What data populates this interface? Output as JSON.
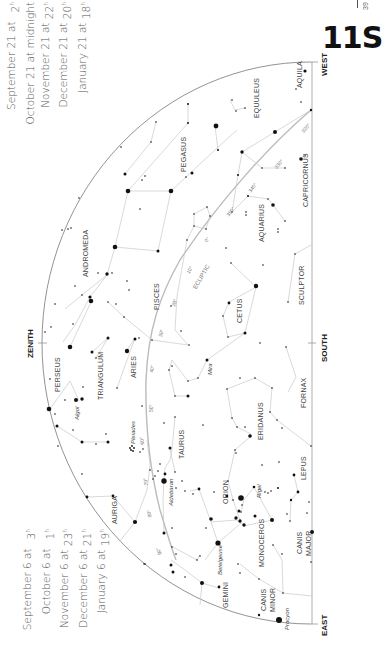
{
  "page": {
    "chart_id": "11S",
    "page_number": "39"
  },
  "times_top": {
    "rows": [
      {
        "date": "September 21 at",
        "time": "2",
        "sup": "h"
      },
      {
        "date": "October 21 at midnight",
        "time": "",
        "sup": ""
      },
      {
        "date": "November 21 at",
        "time": "22",
        "sup": "h"
      },
      {
        "date": "December 21 at",
        "time": "20",
        "sup": "h"
      },
      {
        "date": "January 21 at",
        "time": "18",
        "sup": "h"
      }
    ]
  },
  "times_bottom": {
    "rows": [
      {
        "date": "September 6 at",
        "time": "3",
        "sup": "h"
      },
      {
        "date": "October 6 at",
        "time": "1",
        "sup": "h"
      },
      {
        "date": "November 6 at",
        "time": "23",
        "sup": "h"
      },
      {
        "date": "December 6 at",
        "time": "21",
        "sup": "h"
      },
      {
        "date": "January 6 at",
        "time": "19",
        "sup": "h"
      }
    ]
  },
  "directions": {
    "west": "WEST",
    "south": "SOUTH",
    "east": "EAST",
    "zenith": "ZENITH"
  },
  "constellations": {
    "aquila": "AQUILA",
    "equuleus": "EQUULEUS",
    "pegasus": "PEGASUS",
    "capricornus": "CAPRICORNUS",
    "aquarius": "AQUARIUS",
    "andromeda": "ANDROMEDA",
    "pisces": "PISCES",
    "sculptor": "SCULPTOR",
    "cetus": "CETUS",
    "perseus": "PERSEUS",
    "triangulum": "TRIANGULUM",
    "aries": "ARIES",
    "fornax": "FORNAX",
    "eridanus": "ERIDANUS",
    "taurus": "TAURUS",
    "auriga": "AURIGA",
    "orion": "ORION",
    "lepus": "LEPUS",
    "monoceros": "MONOCEROS",
    "canis_major_1": "CANIS",
    "canis_major_2": "MAJOR",
    "gemini": "GEMINI",
    "canis_minor_1": "CANIS",
    "canis_minor_2": "MINOR"
  },
  "stars": {
    "algol": "Algol",
    "mira": "Mira",
    "pleiades": "Pleiades",
    "aldebaran": "Aldebaran",
    "rigel": "Rigel",
    "betelgeuse": "Betelgeuse",
    "procyon": "Procyon"
  },
  "ecliptic": {
    "label": "ECLIPTIC",
    "marks": [
      "320°",
      "330°",
      "340°",
      "350°",
      "0°",
      "10°",
      "20°",
      "30°",
      "40°",
      "50°",
      "60°",
      "70°",
      "80°",
      "90°"
    ]
  }
}
